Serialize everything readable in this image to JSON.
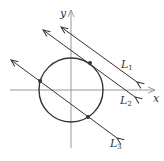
{
  "axes": {
    "x_label": "x",
    "y_label": "y"
  },
  "lines": [
    {
      "name": "L",
      "sub": "1"
    },
    {
      "name": "L",
      "sub": "2"
    },
    {
      "name": "L",
      "sub": "3"
    }
  ],
  "colors": {
    "stroke": "#333333",
    "axis": "#999999"
  }
}
